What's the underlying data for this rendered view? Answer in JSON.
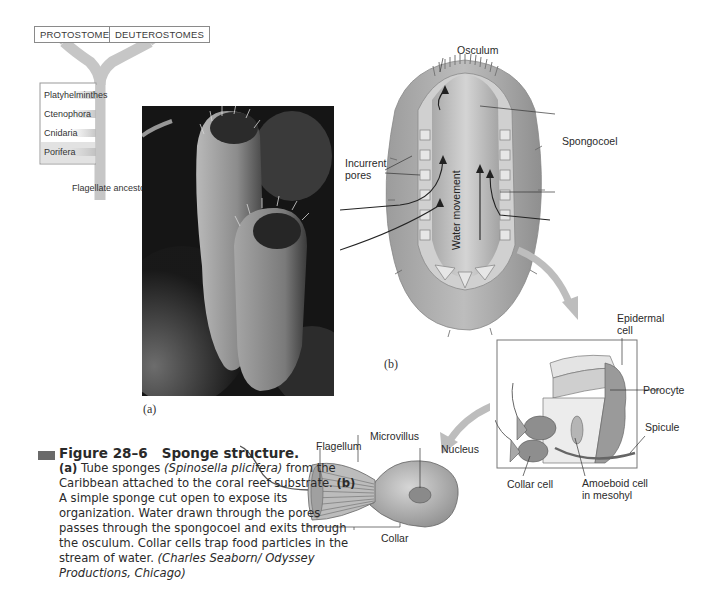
{
  "tree": {
    "groups": [
      "PROTOSTOMES",
      "DEUTEROSTOMES"
    ],
    "phyla": [
      "Platyhelminthes",
      "Ctenophora",
      "Cnidaria",
      "Porifera"
    ],
    "highlighted": "Porifera",
    "root_label": "Flagellate ancestor"
  },
  "photo": {
    "label": "(a)",
    "subject": "Tube sponges (Spinosella plicifera)"
  },
  "diagram_b": {
    "label": "(b)",
    "labels": {
      "osculum": "Osculum",
      "spongocoel": "Spongocoel",
      "incurrent_pores": "Incurrent\npores",
      "water_movement": "Water movement"
    }
  },
  "inset": {
    "labels": {
      "epidermal_cell": "Epidermal cell",
      "porocyte": "Porocyte",
      "spicule": "Spicule",
      "collar_cell": "Collar cell",
      "amoeboid_cell": "Amoeboid cell in mesohyl"
    }
  },
  "collar_cell_detail": {
    "labels": {
      "flagellum": "Flagellum",
      "microvillus": "Microvillus",
      "nucleus": "Nucleus",
      "collar": "Collar"
    }
  },
  "caption": {
    "figure_number": "Figure 28–6",
    "figure_title": "Sponge structure.",
    "part_a_tag": "(a)",
    "part_a_text": " Tube sponges ",
    "part_a_species": "(Spinosella plicifera)",
    "part_a_rest": " from the Caribbean attached to the coral reef substrate. ",
    "part_b_tag": "(b)",
    "part_b_text": " A simple sponge cut open to expose its organization. Water drawn through the pores passes through the spongocoel and exits through the osculum. Collar cells trap food particles in the stream of water.  ",
    "credit": "(Charles Seaborn/ Odyssey Productions, Chicago)"
  },
  "colors": {
    "branch": "#c4c4c4",
    "porifera_band": "#d9d9d9",
    "photo_bg": "#141414",
    "marker": "#6a6a6a"
  }
}
